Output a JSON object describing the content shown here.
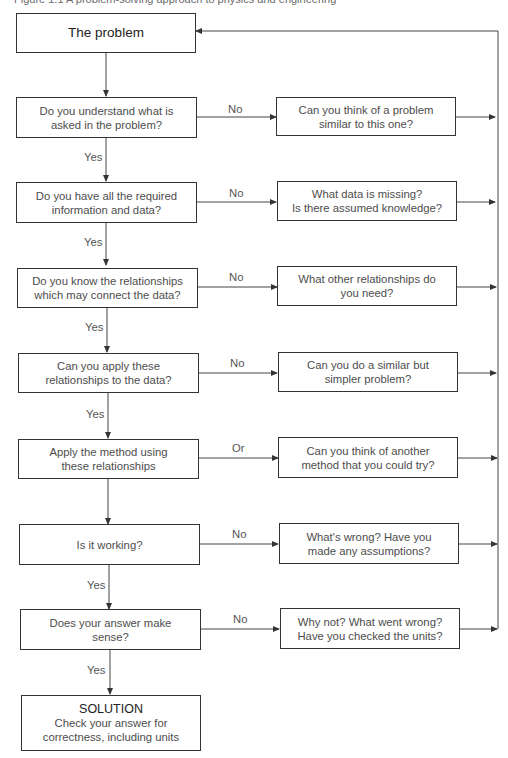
{
  "caption": "Figure 1.1 A problem-solving approach to physics and engineering",
  "colors": {
    "stroke": "#333333",
    "text": "#4d4d4d",
    "background": "#ffffff"
  },
  "start": {
    "label": "The problem"
  },
  "rows": [
    {
      "question": [
        "Do you understand what is",
        "asked in the problem?"
      ],
      "branch_label": "No",
      "down_label": "Yes",
      "alternative": [
        "Can you think of a problem",
        "similar to this one?"
      ]
    },
    {
      "question": [
        "Do you have all the required",
        "information and data?"
      ],
      "branch_label": "No",
      "down_label": "Yes",
      "alternative": [
        "What data is missing?",
        "Is there assumed knowledge?"
      ]
    },
    {
      "question": [
        "Do you know the relationships",
        "which may connect the data?"
      ],
      "branch_label": "No",
      "down_label": "Yes",
      "alternative": [
        "What other relationships do",
        "you need?"
      ]
    },
    {
      "question": [
        "Can you apply these",
        "relationships to the data?"
      ],
      "branch_label": "No",
      "down_label": "Yes",
      "alternative": [
        "Can you do a similar but",
        "simpler problem?"
      ]
    },
    {
      "question": [
        "Apply the method using",
        "these relationships"
      ],
      "branch_label": "Or",
      "down_label": "",
      "alternative": [
        "Can you think of another",
        "method that you could try?"
      ]
    },
    {
      "question": [
        "Is it working?"
      ],
      "branch_label": "No",
      "down_label": "Yes",
      "alternative": [
        "What's wrong? Have you",
        "made any assumptions?"
      ]
    },
    {
      "question": [
        "Does your answer make",
        "sense?"
      ],
      "branch_label": "No",
      "down_label": "Yes",
      "alternative": [
        "Why not? What went wrong?",
        "Have you checked the units?"
      ]
    }
  ],
  "solution": {
    "title": "SOLUTION",
    "lines": [
      "Check your answer for",
      "correctness, including units"
    ]
  }
}
